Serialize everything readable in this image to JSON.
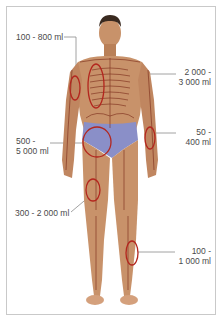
{
  "figure": {
    "colors": {
      "skin": "#c8926a",
      "skin_shadow": "#a56c48",
      "hair": "#3a2a20",
      "bone_lines": "#7a2a18",
      "fracture_circle": "#b3261e",
      "briefs": "#8a8fc8",
      "leader_line": "#8a8a8a",
      "label_text": "#4a4a4a",
      "frame_border": "#c9c9c9"
    }
  },
  "labels": [
    {
      "id": "upper-arm",
      "line1": "100 - 800 ml",
      "line2": ""
    },
    {
      "id": "ribs",
      "line1": "2 000 -",
      "line2": "3 000 ml"
    },
    {
      "id": "forearm",
      "line1": "50 -",
      "line2": "400 ml"
    },
    {
      "id": "pelvis",
      "line1": "500 -",
      "line2": "5 000 ml"
    },
    {
      "id": "femur",
      "line1": "300 - 2 000 ml",
      "line2": ""
    },
    {
      "id": "lower-leg",
      "line1": "100 -",
      "line2": "1 000 ml"
    }
  ]
}
